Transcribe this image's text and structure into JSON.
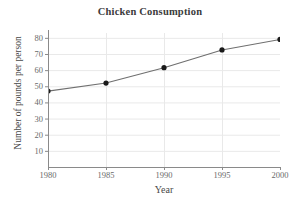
{
  "chart_data": {
    "type": "line",
    "title": "Chicken Consumption",
    "xlabel": "Year",
    "ylabel": "Number of pounds per person",
    "x": [
      1980,
      1985,
      1990,
      1995,
      2000
    ],
    "values": [
      47,
      52,
      61.5,
      72.5,
      79
    ],
    "categories": [
      "1980",
      "1985",
      "1990",
      "1995",
      "2000"
    ],
    "xtick_labels": [
      "1980",
      "1985",
      "1990",
      "1995",
      "2000"
    ],
    "ytick_labels": [
      "10",
      "20",
      "30",
      "40",
      "50",
      "60",
      "70",
      "80"
    ],
    "ytick_values": [
      10,
      20,
      30,
      40,
      50,
      60,
      70,
      80
    ],
    "xlim": [
      1980,
      2000
    ],
    "ylim": [
      0,
      83
    ],
    "grid": true,
    "legend": "none",
    "marker": "filled-circle",
    "line_color": "#6f6f6f",
    "marker_color": "#1a1a1a",
    "grid_color": "#e9e9e9",
    "axis_color": "#8a8a8a",
    "background": "#ffffff"
  }
}
